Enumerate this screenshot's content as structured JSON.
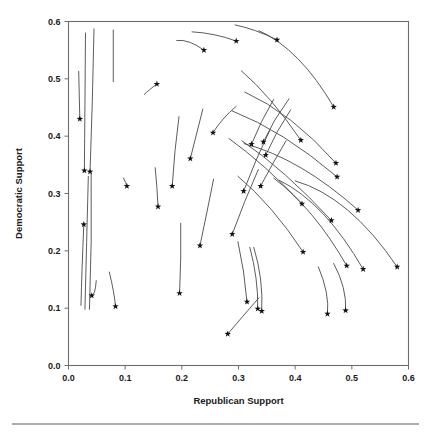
{
  "chart_data": {
    "type": "scatter",
    "title": "",
    "xlabel": "Republican Support",
    "ylabel": "Democratic Support",
    "xlim": [
      0.0,
      0.6
    ],
    "ylim": [
      0.0,
      0.6
    ],
    "grid": false,
    "legend": null,
    "xticks": [
      "0.0",
      "0.1",
      "0.2",
      "0.3",
      "0.4",
      "0.5",
      "0.6"
    ],
    "xtick_values": [
      0.0,
      0.1,
      0.2,
      0.3,
      0.4,
      0.5,
      0.6
    ],
    "yticks": [
      "0.0",
      "0.1",
      "0.2",
      "0.3",
      "0.4",
      "0.5",
      "0.6"
    ],
    "ytick_values": [
      0.0,
      0.1,
      0.2,
      0.3,
      0.4,
      0.5,
      0.6
    ],
    "marker": "star",
    "marker_color": "#111111",
    "line_color": "#4a4a4a",
    "points": [
      {
        "x": 0.02,
        "y": 0.43
      },
      {
        "x": 0.028,
        "y": 0.34
      },
      {
        "x": 0.038,
        "y": 0.338
      },
      {
        "x": 0.027,
        "y": 0.246
      },
      {
        "x": 0.041,
        "y": 0.122
      },
      {
        "x": 0.083,
        "y": 0.103
      },
      {
        "x": 0.103,
        "y": 0.313
      },
      {
        "x": 0.156,
        "y": 0.491
      },
      {
        "x": 0.158,
        "y": 0.277
      },
      {
        "x": 0.183,
        "y": 0.313
      },
      {
        "x": 0.196,
        "y": 0.126
      },
      {
        "x": 0.215,
        "y": 0.361
      },
      {
        "x": 0.232,
        "y": 0.209
      },
      {
        "x": 0.239,
        "y": 0.55
      },
      {
        "x": 0.255,
        "y": 0.406
      },
      {
        "x": 0.281,
        "y": 0.055
      },
      {
        "x": 0.289,
        "y": 0.229
      },
      {
        "x": 0.296,
        "y": 0.566
      },
      {
        "x": 0.309,
        "y": 0.304
      },
      {
        "x": 0.315,
        "y": 0.111
      },
      {
        "x": 0.323,
        "y": 0.386
      },
      {
        "x": 0.334,
        "y": 0.099
      },
      {
        "x": 0.339,
        "y": 0.313
      },
      {
        "x": 0.341,
        "y": 0.095
      },
      {
        "x": 0.344,
        "y": 0.39
      },
      {
        "x": 0.348,
        "y": 0.367
      },
      {
        "x": 0.368,
        "y": 0.568
      },
      {
        "x": 0.41,
        "y": 0.393
      },
      {
        "x": 0.412,
        "y": 0.282
      },
      {
        "x": 0.414,
        "y": 0.198
      },
      {
        "x": 0.457,
        "y": 0.09
      },
      {
        "x": 0.464,
        "y": 0.253
      },
      {
        "x": 0.468,
        "y": 0.451
      },
      {
        "x": 0.472,
        "y": 0.353
      },
      {
        "x": 0.474,
        "y": 0.329
      },
      {
        "x": 0.489,
        "y": 0.096
      },
      {
        "x": 0.491,
        "y": 0.174
      },
      {
        "x": 0.511,
        "y": 0.271
      },
      {
        "x": 0.52,
        "y": 0.168
      },
      {
        "x": 0.58,
        "y": 0.172
      }
    ],
    "trajectories": [
      {
        "start": {
          "x": 0.018,
          "y": 0.513
        },
        "mid": {
          "x": 0.019,
          "y": 0.47
        },
        "end": {
          "x": 0.02,
          "y": 0.43
        }
      },
      {
        "start": {
          "x": 0.03,
          "y": 0.58
        },
        "mid": {
          "x": 0.029,
          "y": 0.455
        },
        "end": {
          "x": 0.028,
          "y": 0.34
        }
      },
      {
        "start": {
          "x": 0.045,
          "y": 0.587
        },
        "mid": {
          "x": 0.042,
          "y": 0.46
        },
        "end": {
          "x": 0.038,
          "y": 0.338
        }
      },
      {
        "start": {
          "x": 0.079,
          "y": 0.585
        },
        "mid": {
          "x": 0.079,
          "y": 0.54
        },
        "end": {
          "x": 0.079,
          "y": 0.495
        }
      },
      {
        "start": {
          "x": 0.022,
          "y": 0.105
        },
        "mid": {
          "x": 0.024,
          "y": 0.17
        },
        "end": {
          "x": 0.027,
          "y": 0.246
        }
      },
      {
        "start": {
          "x": 0.029,
          "y": 0.098
        },
        "mid": {
          "x": 0.032,
          "y": 0.215
        },
        "end": {
          "x": 0.035,
          "y": 0.33
        }
      },
      {
        "start": {
          "x": 0.037,
          "y": 0.098
        },
        "mid": {
          "x": 0.04,
          "y": 0.215
        },
        "end": {
          "x": 0.04,
          "y": 0.335
        }
      },
      {
        "start": {
          "x": 0.049,
          "y": 0.148
        },
        "mid": {
          "x": 0.046,
          "y": 0.128
        },
        "end": {
          "x": 0.041,
          "y": 0.122
        }
      },
      {
        "start": {
          "x": 0.072,
          "y": 0.163
        },
        "mid": {
          "x": 0.079,
          "y": 0.131
        },
        "end": {
          "x": 0.083,
          "y": 0.103
        }
      },
      {
        "start": {
          "x": 0.097,
          "y": 0.327
        },
        "mid": {
          "x": 0.101,
          "y": 0.319
        },
        "end": {
          "x": 0.103,
          "y": 0.313
        }
      },
      {
        "start": {
          "x": 0.134,
          "y": 0.473
        },
        "mid": {
          "x": 0.143,
          "y": 0.481
        },
        "end": {
          "x": 0.156,
          "y": 0.491
        }
      },
      {
        "start": {
          "x": 0.153,
          "y": 0.345
        },
        "mid": {
          "x": 0.156,
          "y": 0.31
        },
        "end": {
          "x": 0.158,
          "y": 0.277
        }
      },
      {
        "start": {
          "x": 0.195,
          "y": 0.434
        },
        "mid": {
          "x": 0.188,
          "y": 0.375
        },
        "end": {
          "x": 0.183,
          "y": 0.313
        }
      },
      {
        "start": {
          "x": 0.198,
          "y": 0.248
        },
        "mid": {
          "x": 0.198,
          "y": 0.186
        },
        "end": {
          "x": 0.196,
          "y": 0.126
        }
      },
      {
        "start": {
          "x": 0.237,
          "y": 0.447
        },
        "mid": {
          "x": 0.226,
          "y": 0.404
        },
        "end": {
          "x": 0.215,
          "y": 0.361
        }
      },
      {
        "start": {
          "x": 0.256,
          "y": 0.325
        },
        "mid": {
          "x": 0.244,
          "y": 0.266
        },
        "end": {
          "x": 0.232,
          "y": 0.209
        }
      },
      {
        "start": {
          "x": 0.191,
          "y": 0.567
        },
        "mid": {
          "x": 0.214,
          "y": 0.564
        },
        "end": {
          "x": 0.239,
          "y": 0.55
        }
      },
      {
        "start": {
          "x": 0.296,
          "y": 0.452
        },
        "mid": {
          "x": 0.273,
          "y": 0.43
        },
        "end": {
          "x": 0.255,
          "y": 0.406
        }
      },
      {
        "start": {
          "x": 0.336,
          "y": 0.118
        },
        "mid": {
          "x": 0.307,
          "y": 0.085
        },
        "end": {
          "x": 0.281,
          "y": 0.055
        }
      },
      {
        "start": {
          "x": 0.335,
          "y": 0.342
        },
        "mid": {
          "x": 0.311,
          "y": 0.286
        },
        "end": {
          "x": 0.289,
          "y": 0.229
        }
      },
      {
        "start": {
          "x": 0.218,
          "y": 0.582
        },
        "mid": {
          "x": 0.257,
          "y": 0.577
        },
        "end": {
          "x": 0.296,
          "y": 0.566
        }
      },
      {
        "start": {
          "x": 0.355,
          "y": 0.41
        },
        "mid": {
          "x": 0.331,
          "y": 0.358
        },
        "end": {
          "x": 0.309,
          "y": 0.304
        }
      },
      {
        "start": {
          "x": 0.299,
          "y": 0.216
        },
        "mid": {
          "x": 0.309,
          "y": 0.163
        },
        "end": {
          "x": 0.315,
          "y": 0.111
        }
      },
      {
        "start": {
          "x": 0.362,
          "y": 0.464
        },
        "mid": {
          "x": 0.341,
          "y": 0.426
        },
        "end": {
          "x": 0.323,
          "y": 0.386
        }
      },
      {
        "start": {
          "x": 0.32,
          "y": 0.206
        },
        "mid": {
          "x": 0.331,
          "y": 0.152
        },
        "end": {
          "x": 0.334,
          "y": 0.099
        }
      },
      {
        "start": {
          "x": 0.384,
          "y": 0.392
        },
        "mid": {
          "x": 0.361,
          "y": 0.353
        },
        "end": {
          "x": 0.339,
          "y": 0.313
        }
      },
      {
        "start": {
          "x": 0.327,
          "y": 0.206
        },
        "mid": {
          "x": 0.339,
          "y": 0.151
        },
        "end": {
          "x": 0.341,
          "y": 0.095
        }
      },
      {
        "start": {
          "x": 0.389,
          "y": 0.465
        },
        "mid": {
          "x": 0.364,
          "y": 0.428
        },
        "end": {
          "x": 0.344,
          "y": 0.39
        }
      },
      {
        "start": {
          "x": 0.392,
          "y": 0.446
        },
        "mid": {
          "x": 0.368,
          "y": 0.407
        },
        "end": {
          "x": 0.348,
          "y": 0.367
        }
      },
      {
        "start": {
          "x": 0.294,
          "y": 0.594
        },
        "mid": {
          "x": 0.33,
          "y": 0.584
        },
        "end": {
          "x": 0.368,
          "y": 0.568
        }
      },
      {
        "start": {
          "x": 0.305,
          "y": 0.514
        },
        "mid": {
          "x": 0.357,
          "y": 0.462
        },
        "end": {
          "x": 0.41,
          "y": 0.393
        }
      },
      {
        "start": {
          "x": 0.283,
          "y": 0.396
        },
        "mid": {
          "x": 0.347,
          "y": 0.345
        },
        "end": {
          "x": 0.412,
          "y": 0.282
        }
      },
      {
        "start": {
          "x": 0.299,
          "y": 0.33
        },
        "mid": {
          "x": 0.358,
          "y": 0.272
        },
        "end": {
          "x": 0.414,
          "y": 0.198
        }
      },
      {
        "start": {
          "x": 0.441,
          "y": 0.172
        },
        "mid": {
          "x": 0.455,
          "y": 0.128
        },
        "end": {
          "x": 0.457,
          "y": 0.09
        }
      },
      {
        "start": {
          "x": 0.306,
          "y": 0.392
        },
        "mid": {
          "x": 0.383,
          "y": 0.332
        },
        "end": {
          "x": 0.464,
          "y": 0.253
        }
      },
      {
        "start": {
          "x": 0.336,
          "y": 0.584
        },
        "mid": {
          "x": 0.405,
          "y": 0.535
        },
        "end": {
          "x": 0.468,
          "y": 0.451
        }
      },
      {
        "start": {
          "x": 0.311,
          "y": 0.477
        },
        "mid": {
          "x": 0.392,
          "y": 0.428
        },
        "end": {
          "x": 0.472,
          "y": 0.353
        }
      },
      {
        "start": {
          "x": 0.289,
          "y": 0.444
        },
        "mid": {
          "x": 0.38,
          "y": 0.398
        },
        "end": {
          "x": 0.474,
          "y": 0.329
        }
      },
      {
        "start": {
          "x": 0.468,
          "y": 0.178
        },
        "mid": {
          "x": 0.485,
          "y": 0.136
        },
        "end": {
          "x": 0.489,
          "y": 0.096
        }
      },
      {
        "start": {
          "x": 0.362,
          "y": 0.327
        },
        "mid": {
          "x": 0.43,
          "y": 0.262
        },
        "end": {
          "x": 0.491,
          "y": 0.174
        }
      },
      {
        "start": {
          "x": 0.31,
          "y": 0.387
        },
        "mid": {
          "x": 0.41,
          "y": 0.345
        },
        "end": {
          "x": 0.511,
          "y": 0.271
        }
      },
      {
        "start": {
          "x": 0.372,
          "y": 0.323
        },
        "mid": {
          "x": 0.449,
          "y": 0.265
        },
        "end": {
          "x": 0.52,
          "y": 0.168
        }
      },
      {
        "start": {
          "x": 0.4,
          "y": 0.322
        },
        "mid": {
          "x": 0.493,
          "y": 0.271
        },
        "end": {
          "x": 0.58,
          "y": 0.172
        }
      }
    ]
  }
}
